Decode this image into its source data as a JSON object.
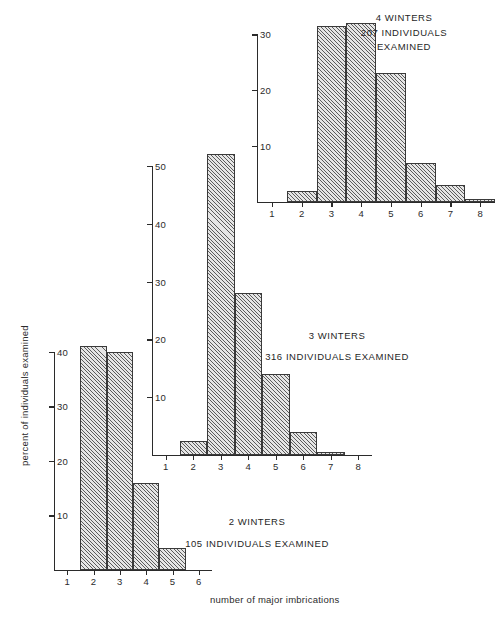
{
  "figure": {
    "xlabel": "number of major imbrications",
    "ylabel": "percent of individuals examined"
  },
  "chart_data": [
    {
      "id": "panel-2-winters",
      "type": "bar",
      "title": "2 WINTERS",
      "subtitle": "105 INDIVIDUALS EXAMINED",
      "n_examined": 105,
      "winters": 2,
      "xlabel": "number of major imbrications",
      "ylabel": "percent of individuals examined",
      "categories": [
        1,
        2,
        3,
        4,
        5,
        6
      ],
      "values": [
        0,
        41,
        40,
        16,
        4,
        0
      ],
      "x_ticks": [
        "1",
        "2",
        "3",
        "4",
        "5",
        "6"
      ],
      "y_ticks": [
        "10",
        "20",
        "30",
        "40"
      ],
      "y_tick_values": [
        10,
        20,
        30,
        40
      ],
      "ylim": [
        0,
        44
      ],
      "xlim": [
        0.5,
        6.5
      ],
      "grid": false,
      "legend": "none"
    },
    {
      "id": "panel-3-winters",
      "type": "bar",
      "title": "3 WINTERS",
      "subtitle": "316 INDIVIDUALS EXAMINED",
      "n_examined": 316,
      "winters": 3,
      "xlabel": "number of major imbrications",
      "ylabel": "percent of individuals examined",
      "categories": [
        1,
        2,
        3,
        4,
        5,
        6,
        7,
        8
      ],
      "values": [
        0,
        2.5,
        52,
        28,
        14,
        4,
        0.6,
        0
      ],
      "x_ticks": [
        "1",
        "2",
        "3",
        "4",
        "5",
        "6",
        "7",
        "8"
      ],
      "y_ticks": [
        "10",
        "20",
        "30",
        "40",
        "50"
      ],
      "y_tick_values": [
        10,
        20,
        30,
        40,
        50
      ],
      "ylim": [
        0,
        55
      ],
      "xlim": [
        0.5,
        8.5
      ],
      "grid": false,
      "legend": "none"
    },
    {
      "id": "panel-4-winters",
      "type": "bar",
      "title": "4 WINTERS",
      "subtitle": "207 INDIVIDUALS",
      "subtitle2": "EXAMINED",
      "n_examined": 207,
      "winters": 4,
      "xlabel": "number of major imbrications",
      "ylabel": "percent of individuals examined",
      "categories": [
        1,
        2,
        3,
        4,
        5,
        6,
        7,
        8
      ],
      "values": [
        0,
        2,
        31.5,
        32,
        23,
        7,
        3,
        0.6
      ],
      "x_ticks": [
        "1",
        "2",
        "3",
        "4",
        "5",
        "6",
        "7",
        "8"
      ],
      "y_ticks": [
        "10",
        "20",
        "30"
      ],
      "y_tick_values": [
        10,
        20,
        30
      ],
      "ylim": [
        0,
        34
      ],
      "xlim": [
        0.5,
        8.5
      ],
      "grid": false,
      "legend": "none"
    }
  ],
  "colors": {
    "ink": "#2b2b2b",
    "bar_fill": "#e6e6e6",
    "bar_hatch": "#5c5c5c",
    "background": "#ffffff"
  }
}
